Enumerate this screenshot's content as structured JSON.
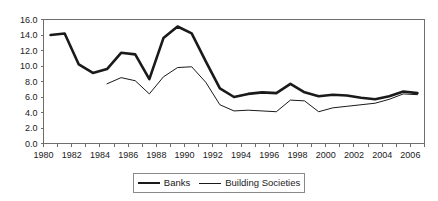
{
  "chart_data": {
    "type": "line",
    "title": "",
    "subtitle": "",
    "xlabel": "",
    "ylabel": "",
    "xlim": [
      1980,
      2007
    ],
    "ylim": [
      0.0,
      16.0
    ],
    "grid": false,
    "legend_position": "bottom-center",
    "y_ticks": [
      "0.0",
      "2.0",
      "4.0",
      "6.0",
      "8.0",
      "10.0",
      "12.0",
      "14.0",
      "16.0"
    ],
    "y_tick_values": [
      0.0,
      2.0,
      4.0,
      6.0,
      8.0,
      10.0,
      12.0,
      14.0,
      16.0
    ],
    "x_ticks": [
      "1980",
      "1982",
      "1984",
      "1986",
      "1988",
      "1990",
      "1992",
      "1994",
      "1996",
      "1998",
      "2000",
      "2002",
      "2004",
      "2006"
    ],
    "x_tick_values": [
      1980,
      1982,
      1984,
      1986,
      1988,
      1990,
      1992,
      1994,
      1996,
      1998,
      2000,
      2002,
      2004,
      2006
    ],
    "x_minor_tick_values": [
      1980,
      1981,
      1982,
      1983,
      1984,
      1985,
      1986,
      1987,
      1988,
      1989,
      1990,
      1991,
      1992,
      1993,
      1994,
      1995,
      1996,
      1997,
      1998,
      1999,
      2000,
      2001,
      2002,
      2003,
      2004,
      2005,
      2006,
      2007
    ],
    "series": [
      {
        "name": "Banks",
        "style": "thick",
        "color": "#1a1a1a",
        "x": [
          1980.5,
          1981.5,
          1982.5,
          1983.5,
          1984.5,
          1985.5,
          1986.5,
          1987.5,
          1988.5,
          1989.5,
          1990.5,
          1991.5,
          1992.5,
          1993.5,
          1994.5,
          1995.5,
          1996.5,
          1997.5,
          1998.5,
          1999.5,
          2000.5,
          2001.5,
          2002.5,
          2003.5,
          2004.5,
          2005.5,
          2006.5
        ],
        "values": [
          14.0,
          14.2,
          10.2,
          9.1,
          9.6,
          11.7,
          11.5,
          8.3,
          13.6,
          15.1,
          14.2,
          10.6,
          7.1,
          6.0,
          6.4,
          6.6,
          6.5,
          7.7,
          6.6,
          6.1,
          6.3,
          6.2,
          5.9,
          5.7,
          6.1,
          6.7,
          6.5
        ]
      },
      {
        "name": "Building Societies",
        "style": "thin",
        "color": "#1a1a1a",
        "x": [
          1984.5,
          1985.5,
          1986.5,
          1987.5,
          1988.5,
          1989.5,
          1990.5,
          1991.5,
          1992.5,
          1993.5,
          1994.5,
          1995.5,
          1996.5,
          1997.5,
          1998.5,
          1999.5,
          2000.5,
          2001.5,
          2002.5,
          2003.5,
          2004.5,
          2005.5,
          2006.5
        ],
        "values": [
          7.7,
          8.5,
          8.1,
          6.4,
          8.6,
          9.8,
          9.9,
          7.9,
          5.0,
          4.2,
          4.3,
          4.2,
          4.1,
          5.6,
          5.5,
          4.1,
          4.6,
          4.8,
          5.0,
          5.2,
          5.7,
          6.4,
          6.3
        ]
      }
    ]
  },
  "legend": {
    "entries": [
      {
        "label": "Banks"
      },
      {
        "label": "Building Societies"
      }
    ]
  }
}
